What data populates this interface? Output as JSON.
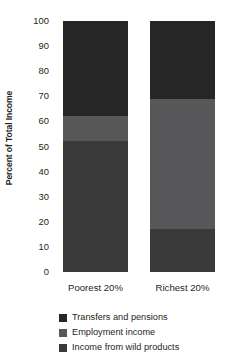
{
  "chart_data": {
    "type": "bar",
    "subtype": "stacked-bar-100-percent",
    "title": "",
    "xlabel": "",
    "ylabel": "Percent of Total Income",
    "categories": [
      "Poorest 20%",
      "Richest 20%"
    ],
    "ylim": [
      0,
      100
    ],
    "yticks": [
      0,
      10,
      20,
      30,
      40,
      50,
      60,
      70,
      80,
      90,
      100
    ],
    "ytick_labels": [
      "0",
      "10",
      "20",
      "30",
      "40",
      "50",
      "60",
      "70",
      "80",
      "90",
      "100"
    ],
    "grid": false,
    "legend_position": "bottom-left",
    "stack_order_bottom_to_top": [
      "Income from wild products",
      "Employment income",
      "Transfers and pensions"
    ],
    "series": [
      {
        "name": "Transfers and pensions",
        "color": "#262626",
        "values": [
          38,
          31
        ]
      },
      {
        "name": "Employment income",
        "color": "#58585a",
        "values": [
          10,
          52
        ]
      },
      {
        "name": "Income from wild products",
        "color": "#3a3a3a",
        "values": [
          52,
          17
        ]
      }
    ],
    "cumulative_boundaries": {
      "Poorest 20%": [
        0,
        52,
        62,
        100
      ],
      "Richest 20%": [
        0,
        17,
        69,
        100
      ]
    }
  },
  "axis": {
    "y_title": "Percent of Total Income"
  },
  "legend": {
    "items": [
      {
        "label": "Transfers and pensions",
        "color": "#262626"
      },
      {
        "label": "Employment income",
        "color": "#58585a"
      },
      {
        "label": "Income from wild products",
        "color": "#3a3a3a"
      }
    ]
  },
  "colors": {
    "transfers_and_pensions": "#262626",
    "employment_income": "#58585a",
    "income_from_wild_products": "#3a3a3a",
    "text": "#231f20",
    "background": "#ffffff"
  }
}
